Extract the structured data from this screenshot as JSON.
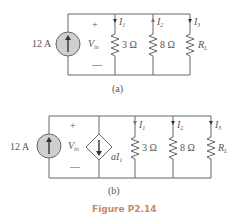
{
  "figure": {
    "caption": "Figure P2.14",
    "caption_color": "#c58a6a",
    "circuit_a": {
      "label": "(a)",
      "source": "12 A",
      "voltage_label": "V",
      "voltage_sub": "in",
      "plus": "+",
      "minus": "—",
      "branches": [
        {
          "current": "I",
          "sub": "1",
          "resistor": "3 Ω"
        },
        {
          "current": "I",
          "sub": "2",
          "resistor": "8 Ω"
        },
        {
          "current": "I",
          "sub": "3",
          "resistor": "R",
          "resistor_sub": "L"
        }
      ]
    },
    "circuit_b": {
      "label": "(b)",
      "source": "12 A",
      "voltage_label": "V",
      "voltage_sub": "in",
      "plus": "+",
      "minus": "—",
      "dependent_source": "aI",
      "dependent_sub": "1",
      "branches": [
        {
          "current": "I",
          "sub": "1",
          "resistor": "3 Ω"
        },
        {
          "current": "I",
          "sub": "2",
          "resistor": "8 Ω"
        },
        {
          "current": "I",
          "sub": "3",
          "resistor": "R",
          "resistor_sub": "L"
        }
      ]
    }
  }
}
